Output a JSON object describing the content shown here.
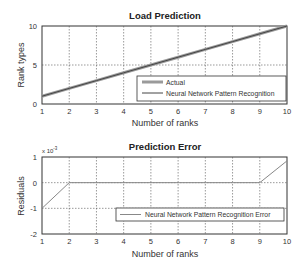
{
  "chart_data": [
    {
      "type": "line",
      "title": "Load Prediction",
      "xlabel": "Number of ranks",
      "ylabel": "Rank types",
      "xlim": [
        1,
        10
      ],
      "ylim": [
        0,
        10
      ],
      "xticks": [
        "1",
        "2",
        "3",
        "4",
        "5",
        "6",
        "7",
        "8",
        "9",
        "10"
      ],
      "yticks": [
        "0",
        "5",
        "10"
      ],
      "grid": true,
      "legend_position": "lower right",
      "x": [
        1,
        2,
        3,
        4,
        5,
        6,
        7,
        8,
        9,
        10
      ],
      "series": [
        {
          "name": "Actual",
          "values": [
            1,
            2,
            3,
            4,
            5,
            6,
            7,
            8,
            9,
            10
          ],
          "color": "#9a9a9a",
          "width": 3
        },
        {
          "name": "Neural Network Pattern Recognition",
          "values": [
            1,
            2,
            3,
            4,
            5,
            6,
            7,
            8,
            9,
            10
          ],
          "color": "#444444",
          "width": 1
        }
      ]
    },
    {
      "type": "line",
      "title": "Prediction Error",
      "xlabel": "Number of ranks",
      "ylabel": "Residuals",
      "y_scale_label": "x 10^-3",
      "xlim": [
        1,
        10
      ],
      "ylim": [
        -2,
        1
      ],
      "xticks": [
        "1",
        "2",
        "3",
        "4",
        "5",
        "6",
        "7",
        "8",
        "9",
        "10"
      ],
      "yticks": [
        "-2",
        "-1",
        "0",
        "1"
      ],
      "grid": true,
      "legend_position": "lower right",
      "x": [
        1,
        2,
        3,
        4,
        5,
        6,
        7,
        8,
        9,
        10
      ],
      "series": [
        {
          "name": "Neural Network Pattern Recognition Error",
          "values": [
            -1,
            0,
            0,
            0,
            0,
            0,
            0,
            0,
            0,
            0.85
          ],
          "color": "#888888",
          "width": 1
        }
      ]
    }
  ],
  "labels": {
    "top_title": "Load Prediction",
    "top_xlabel": "Number of ranks",
    "top_ylabel": "Rank types",
    "legend_actual": "Actual",
    "legend_nn": "Neural Network Pattern Recognition",
    "bottom_title": "Prediction Error",
    "bottom_xlabel": "Number of ranks",
    "bottom_ylabel": "Residuals",
    "scale_x": "x 10",
    "scale_exp": "-3",
    "legend_error": "Neural Network Pattern Recognition Error"
  }
}
